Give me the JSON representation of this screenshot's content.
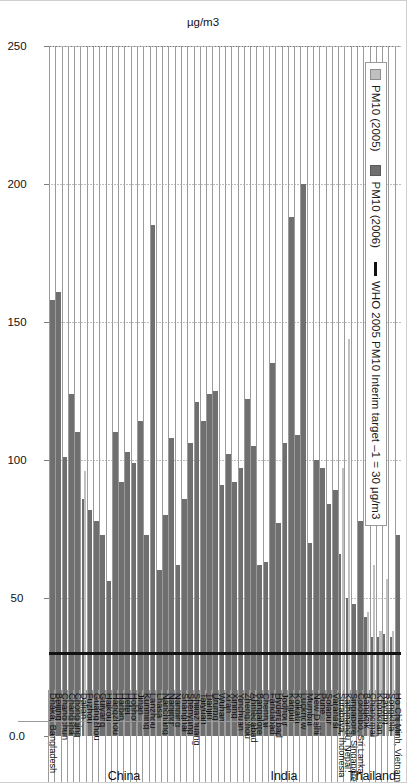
{
  "axis": {
    "y_axis_title": "µg/m3",
    "x_ticks": [
      "250",
      "200",
      "150",
      "100",
      "50",
      "0.0"
    ]
  },
  "legend": {
    "items": [
      {
        "label": "PM10 (2005)",
        "swatch": "light-gray-square",
        "color": "#c0c0c0"
      },
      {
        "label": "PM10 (2006)",
        "swatch": "dark-gray-square",
        "color": "#6f6f6f"
      },
      {
        "label": "WHO 2005 PM10 Interim target –1 = 30 µg/m3",
        "swatch": "black-line",
        "color": "#111111"
      }
    ]
  },
  "groups": [
    {
      "name": "Thailand",
      "first": 1,
      "last": 5
    },
    {
      "name": "India",
      "first": 10,
      "last": 24
    },
    {
      "name": "China",
      "first": 25,
      "last": 60
    }
  ],
  "chart_data": {
    "type": "bar",
    "orientation": "horizontal",
    "title": "",
    "xlabel": "",
    "ylabel": "µg/m3",
    "xlim": [
      0,
      250
    ],
    "grid": true,
    "legend_position": "top-left",
    "reference_line": {
      "label": "WHO 2005 PM10 Interim target –1 = 30 µg/m3",
      "value": 30,
      "color": "#111111"
    },
    "categories": [
      "Ho Chi Minh, Vietnam",
      "Songkhla",
      "Rayong",
      "Khonkean",
      "Chiangmai",
      "Bangkok",
      "Colombo, Sri Lanka",
      "Singapore, Singapore",
      "Kathmandu, Nepal",
      "Surabaya, Indonesia",
      "Varanasi",
      "Solapur",
      "Pune",
      "New Delhi",
      "Mumbai",
      "Lucknow",
      "Kolkata",
      "Kanpur",
      "Jodhpur",
      "Hyderabad",
      "Faridabad",
      "Chennai",
      "Bangalore",
      "Ahmedabad",
      "Zhengzhou",
      "Yinchuan",
      "Xining",
      "Xi'an",
      "Wuhan",
      "Urumqi",
      "Tianjin",
      "Taiyuan",
      "Shijiazhuang",
      "Shenyang",
      "Shanghai",
      "Nanning",
      "Nanjing",
      "Nanchang",
      "Lhasa",
      "Lanzhou",
      "Kunming",
      "Jinan",
      "Hohhot",
      "Hefei",
      "Harbin",
      "Hangzhou",
      "Haikou",
      "Guiyang",
      "Guangzhou",
      "Fuzhou",
      "Dalian",
      "Chongqing",
      "Changsha",
      "Changchun",
      "Beijing",
      "Dhaka, Bangladesh"
    ],
    "series": [
      {
        "name": "PM10 (2005)",
        "color": "#c0c0c0",
        "values": [
          null,
          38,
          57,
          38,
          62,
          45,
          null,
          null,
          144,
          97,
          null,
          null,
          null,
          null,
          null,
          null,
          null,
          null,
          null,
          null,
          null,
          null,
          null,
          null,
          null,
          null,
          null,
          null,
          null,
          null,
          null,
          null,
          null,
          null,
          null,
          null,
          null,
          null,
          null,
          null,
          null,
          null,
          null,
          null,
          null,
          null,
          null,
          null,
          null,
          null,
          96,
          null,
          null,
          null,
          null,
          null
        ]
      },
      {
        "name": "PM10 (2006)",
        "color": "#6f6f6f",
        "values": [
          73,
          36,
          37,
          36,
          36,
          43,
          78,
          48,
          50,
          66,
          89,
          84,
          97,
          100,
          70,
          200,
          109,
          188,
          106,
          77,
          135,
          63,
          62,
          105,
          122,
          97,
          92,
          102,
          91,
          125,
          124,
          114,
          121,
          106,
          86,
          62,
          108,
          80,
          60,
          185,
          73,
          114,
          99,
          103,
          92,
          110,
          56,
          73,
          78,
          82,
          86,
          110,
          124,
          101,
          161,
          158
        ]
      }
    ]
  }
}
